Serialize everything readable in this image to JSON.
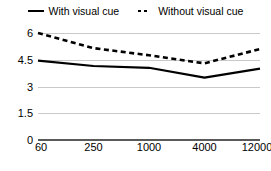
{
  "legend": {
    "entries": [
      {
        "label": "With visual cue",
        "style": "solid",
        "icon": "solid-line-icon"
      },
      {
        "label": "Without visual cue",
        "style": "dashed",
        "icon": "dashed-line-icon"
      }
    ]
  },
  "chart_data": {
    "type": "line",
    "title": "",
    "subtitle": "",
    "xlabel": "",
    "ylabel": "",
    "categories": [
      "60",
      "250",
      "1000",
      "4000",
      "12000"
    ],
    "series": [
      {
        "name": "With visual cue",
        "style": "solid",
        "values": [
          4.45,
          4.15,
          4.05,
          3.5,
          4.0
        ]
      },
      {
        "name": "Without visual cue",
        "style": "dashed",
        "values": [
          6.0,
          5.15,
          4.75,
          4.3,
          5.1
        ]
      }
    ],
    "ylim": [
      0,
      6
    ],
    "yticks": [
      "0",
      "1.5",
      "3",
      "4.5",
      "6"
    ],
    "ytick_values": [
      0,
      1.5,
      3,
      4.5,
      6
    ],
    "grid": true,
    "legend_position": "top",
    "colors": {
      "line": "#000000",
      "gridline": "#c9c9c9",
      "baseline": "#5a5a5a",
      "background": "#ffffff"
    }
  }
}
